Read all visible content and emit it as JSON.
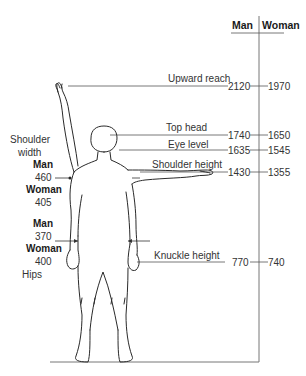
{
  "header": {
    "col_man": "Man",
    "col_woman": "Woman"
  },
  "measurements": [
    {
      "label": "Upward reach",
      "man": "2120",
      "woman": "1970"
    },
    {
      "label": "Top head",
      "man": "1740",
      "woman": "1650"
    },
    {
      "label": "Eye level",
      "man": "1635",
      "woman": "1545"
    },
    {
      "label": "Shoulder height",
      "man": "1430",
      "woman": "1355"
    },
    {
      "label": "Knuckle height",
      "man": "770",
      "woman": "740"
    }
  ],
  "shoulder_width": {
    "title_line1": "Shoulder",
    "title_line2": "width",
    "man_label": "Man",
    "man_value": "460",
    "woman_label": "Woman",
    "woman_value": "405"
  },
  "hips": {
    "man_label": "Man",
    "man_value": "370",
    "woman_label": "Woman",
    "woman_value": "400",
    "title": "Hips"
  },
  "colors": {
    "line": "#333333",
    "axis": "#777777",
    "text": "#333333"
  }
}
